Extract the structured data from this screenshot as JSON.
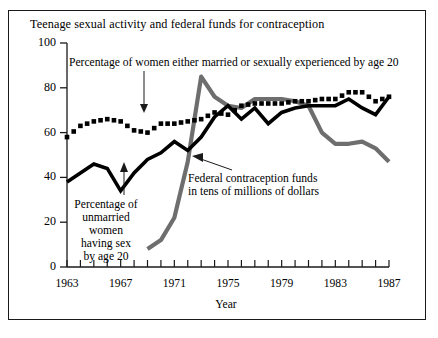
{
  "chart_data": {
    "type": "line",
    "title": "Teenage sexual activity and federal funds for contraception",
    "xlabel": "Year",
    "ylabel": "",
    "xlim": [
      1963,
      1987
    ],
    "ylim": [
      0,
      100
    ],
    "grid": false,
    "legend_position": "inline-annotations",
    "yticks": [
      0,
      20,
      40,
      60,
      80,
      100
    ],
    "xticks": [
      1963,
      1967,
      1971,
      1975,
      1979,
      1983,
      1987
    ],
    "xtick_all_years": [
      1963,
      1964,
      1965,
      1966,
      1967,
      1968,
      1969,
      1970,
      1971,
      1972,
      1973,
      1974,
      1975,
      1976,
      1977,
      1978,
      1979,
      1980,
      1981,
      1982,
      1983,
      1984,
      1985,
      1986,
      1987
    ],
    "series": [
      {
        "name": "Percentage of women either married or sexually experienced by age 20",
        "style": "dotted-black-squares",
        "color": "#000000",
        "x": [
          1963,
          1964,
          1965,
          1966,
          1967,
          1968,
          1969,
          1970,
          1971,
          1972,
          1973,
          1974,
          1975,
          1976,
          1977,
          1978,
          1979,
          1980,
          1981,
          1982,
          1983,
          1984,
          1985,
          1986,
          1987
        ],
        "values": [
          58,
          63,
          65,
          66,
          65,
          61,
          60,
          64,
          64,
          65,
          66,
          69,
          68,
          72,
          73,
          73,
          73,
          74,
          74,
          75,
          75,
          78,
          78,
          74,
          76
        ]
      },
      {
        "name": "Percentage of unmarried women having sex by age 20",
        "style": "solid-black",
        "color": "#000000",
        "x": [
          1963,
          1964,
          1965,
          1966,
          1967,
          1968,
          1969,
          1970,
          1971,
          1972,
          1973,
          1974,
          1975,
          1976,
          1977,
          1978,
          1979,
          1980,
          1981,
          1982,
          1983,
          1984,
          1985,
          1986,
          1987
        ],
        "values": [
          38,
          42,
          46,
          44,
          34,
          42,
          48,
          51,
          56,
          52,
          58,
          67,
          72,
          66,
          71,
          64,
          69,
          71,
          72,
          72,
          72,
          75,
          71,
          68,
          76
        ]
      },
      {
        "name": "Federal contraception funds in tens of millions of dollars",
        "style": "solid-gray",
        "color": "#6e6e6e",
        "x": [
          1969,
          1970,
          1971,
          1972,
          1973,
          1974,
          1975,
          1976,
          1977,
          1978,
          1979,
          1980,
          1981,
          1982,
          1983,
          1984,
          1985,
          1986,
          1987
        ],
        "values": [
          8,
          12,
          22,
          47,
          85,
          76,
          72,
          71,
          75,
          75,
          75,
          74,
          72,
          60,
          55,
          55,
          56,
          53,
          47
        ]
      }
    ],
    "annotations": [
      {
        "id": "anno-top",
        "text": "Percentage of women either married or sexually experienced by age 20",
        "target_series": "Percentage of women either married or sexually experienced by age 20",
        "arrow": "down"
      },
      {
        "id": "anno-left",
        "text": "Percentage of unmarried women having sex by age 20",
        "target_series": "Percentage of unmarried women having sex by age 20",
        "arrow": "up"
      },
      {
        "id": "anno-mid",
        "text": "Federal contraception funds in tens of millions of dollars",
        "target_series": "Federal contraception funds in tens of millions of dollars",
        "arrow": "up-left"
      }
    ]
  },
  "annotation_lines": {
    "left_l1": "Percentage of",
    "left_l2": "unmarried",
    "left_l3": "women",
    "left_l4": "having sex",
    "left_l5": "by age 20",
    "mid_l1": "Federal contraception funds",
    "mid_l2": "in tens of millions of dollars"
  }
}
